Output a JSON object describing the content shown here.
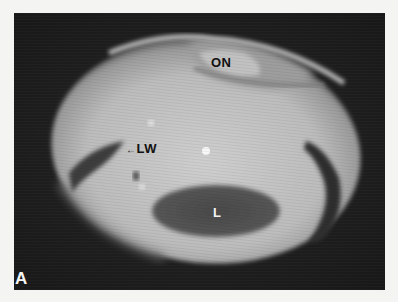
{
  "figure": {
    "panel_label": "A",
    "labels": {
      "optic_nerve": "ON",
      "lateral_wall": "LW",
      "lesion": "L"
    },
    "lateral_wall_pointer": "←",
    "colors": {
      "background_page": "#f4f4f2",
      "frame_background": "#1e1e1e",
      "tissue_bright": "#c9c9c9",
      "tissue_mid": "#a8a8a8",
      "lesion_dark": "#4a4a4a",
      "label_dark": "#111111",
      "label_light": "#f2f2f2"
    }
  }
}
